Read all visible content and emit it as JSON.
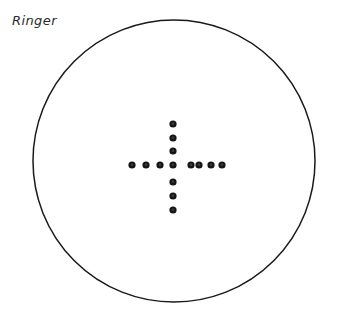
{
  "figure": {
    "label": "Ringer",
    "width": 345,
    "height": 328,
    "background_color": "#ffffff"
  },
  "boundary": {
    "name": "ring-circle",
    "shape": "circle",
    "center_x": 174,
    "center_y": 161,
    "radius": 141,
    "stroke_color": "#1a1a1a",
    "stroke_width": 1.5,
    "fill": "none"
  },
  "marker_style": {
    "fill_color": "#151515",
    "core_color": "#3d3d3d",
    "radius": 3.6,
    "core_radius": 1.3
  },
  "chart_data": {
    "type": "scatter",
    "title": "Ringer",
    "xlabel": "",
    "ylabel": "",
    "grid": false,
    "legend": null,
    "xlim": [
      33,
      315
    ],
    "ylim": [
      15,
      307
    ],
    "annotations": [
      {
        "text": "Ringer",
        "x": 12,
        "y": 20
      }
    ],
    "shapes": [
      {
        "type": "circle",
        "cx": 174,
        "cy": 161,
        "r": 141,
        "fill": "none",
        "stroke": "#1a1a1a"
      }
    ],
    "series": [
      {
        "name": "horizontal-arm",
        "marker": "filled-circle",
        "color": "#151515",
        "points": [
          {
            "x": 132,
            "y": 165
          },
          {
            "x": 146,
            "y": 165
          },
          {
            "x": 160,
            "y": 165
          },
          {
            "x": 173,
            "y": 165
          },
          {
            "x": 191,
            "y": 165
          },
          {
            "x": 199,
            "y": 165
          },
          {
            "x": 211,
            "y": 165
          },
          {
            "x": 222,
            "y": 165
          }
        ]
      },
      {
        "name": "vertical-arm",
        "marker": "filled-circle",
        "color": "#151515",
        "points": [
          {
            "x": 173,
            "y": 124
          },
          {
            "x": 173,
            "y": 138
          },
          {
            "x": 173,
            "y": 151
          },
          {
            "x": 173,
            "y": 165
          },
          {
            "x": 173,
            "y": 182
          },
          {
            "x": 173,
            "y": 196
          },
          {
            "x": 173,
            "y": 210
          }
        ]
      }
    ],
    "counts": {
      "horizontal_dots": 8,
      "vertical_dots": 7,
      "shared_center_dots": 1,
      "total_dots": 14
    }
  }
}
